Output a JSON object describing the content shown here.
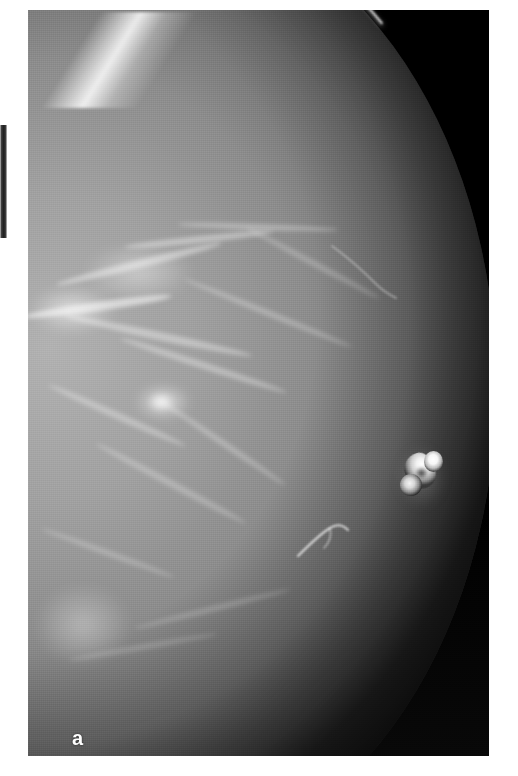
{
  "figure": {
    "panel_label": "a",
    "modality": "mammogram",
    "page_background": "#ffffff",
    "film_background": "#050505",
    "panel": {
      "left": 28,
      "top": 10,
      "width": 461,
      "height": 746
    }
  },
  "annotations": {
    "panel_label_color": "#ffffff",
    "edge_artifact": {
      "name": "left-margin-dark-bar",
      "left": 0,
      "top": 125,
      "width": 7,
      "height": 113
    }
  },
  "anatomy": {
    "breast_tissue_label": "fibroglandular-tissue",
    "skin_line_label": "skin-line",
    "nipple_label": "nipple-in-profile",
    "vessel_label": "curvilinear-vessel",
    "focal_density_label": "focal-density"
  },
  "colors": {
    "tissue_light": "#b5b5b5",
    "tissue_mid": "#949494",
    "tissue_dark": "#565656",
    "background_black": "#030303",
    "skin_highlight": "#f6f6f6",
    "nipple_bright": "#ffffff"
  }
}
